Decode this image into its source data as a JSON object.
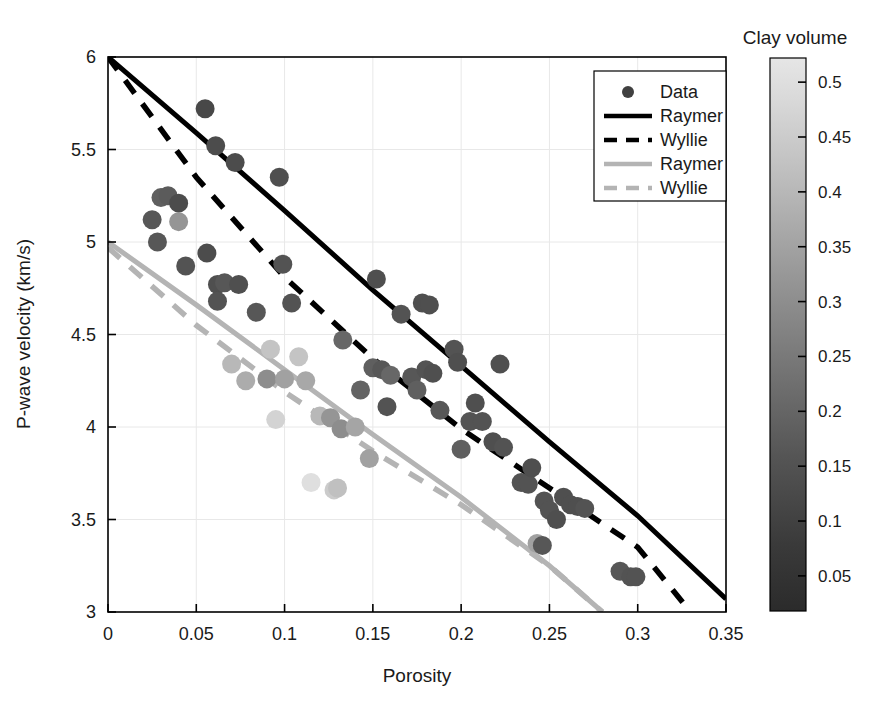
{
  "figure": {
    "background": "#ffffff",
    "width": 882,
    "height": 708
  },
  "axes": {
    "x_label": "Porosity",
    "y_label": "P-wave velocity (km/s)",
    "x_ticks": [
      "0",
      "0.05",
      "0.1",
      "0.15",
      "0.2",
      "0.25",
      "0.3",
      "0.35"
    ],
    "y_ticks": [
      "3",
      "3.5",
      "4",
      "4.5",
      "5",
      "5.5",
      "6"
    ],
    "box_color": "#000000",
    "grid": "on"
  },
  "legend": {
    "border_color": "#000000",
    "background": "#ffffff",
    "items": [
      {
        "label": "Data",
        "marker": "circle",
        "color": "#404040"
      },
      {
        "label": "Raymer",
        "marker": "solid-line",
        "color": "#000000"
      },
      {
        "label": "Wyllie",
        "marker": "dashed-line",
        "color": "#000000"
      },
      {
        "label": "Raymer",
        "marker": "solid-line",
        "color": "#b4b4b4"
      },
      {
        "label": "Wyllie",
        "marker": "dashed-line",
        "color": "#b4b4b4"
      }
    ]
  },
  "colorbar": {
    "title": "Clay volume",
    "ticks": [
      "0.05",
      "0.1",
      "0.15",
      "0.2",
      "0.25",
      "0.3",
      "0.35",
      "0.4",
      "0.45",
      "0.5"
    ],
    "tick_values": [
      0.05,
      0.1,
      0.15,
      0.2,
      0.25,
      0.3,
      0.35,
      0.4,
      0.45,
      0.5
    ],
    "vmin": 0.018,
    "vmax": 0.522,
    "colormap": "gray",
    "low_color": "#2b2b2b",
    "high_color": "#e4e4e4",
    "border_color": "#000000"
  },
  "chart_data": {
    "type": "scatter",
    "title": "",
    "xlabel": "Porosity",
    "ylabel": "P-wave velocity (km/s)",
    "xlim": [
      0,
      0.35
    ],
    "ylim": [
      3,
      6
    ],
    "grid": true,
    "legend_position": "upper-right",
    "colorbar_label": "Clay volume",
    "colorbar_range": [
      0.018,
      0.522
    ],
    "series": [
      {
        "name": "Data",
        "type": "scatter",
        "color_by": "Clay volume",
        "points": [
          {
            "x": 0.025,
            "y": 5.12,
            "c": 0.14
          },
          {
            "x": 0.03,
            "y": 5.24,
            "c": 0.16
          },
          {
            "x": 0.034,
            "y": 5.25,
            "c": 0.15
          },
          {
            "x": 0.028,
            "y": 5.0,
            "c": 0.14
          },
          {
            "x": 0.04,
            "y": 5.21,
            "c": 0.11
          },
          {
            "x": 0.04,
            "y": 5.11,
            "c": 0.3
          },
          {
            "x": 0.044,
            "y": 4.87,
            "c": 0.13
          },
          {
            "x": 0.055,
            "y": 5.72,
            "c": 0.1
          },
          {
            "x": 0.056,
            "y": 4.94,
            "c": 0.11
          },
          {
            "x": 0.061,
            "y": 5.52,
            "c": 0.11
          },
          {
            "x": 0.062,
            "y": 4.77,
            "c": 0.12
          },
          {
            "x": 0.062,
            "y": 4.68,
            "c": 0.13
          },
          {
            "x": 0.066,
            "y": 4.78,
            "c": 0.14
          },
          {
            "x": 0.072,
            "y": 5.43,
            "c": 0.11
          },
          {
            "x": 0.074,
            "y": 4.77,
            "c": 0.12
          },
          {
            "x": 0.07,
            "y": 4.34,
            "c": 0.39
          },
          {
            "x": 0.078,
            "y": 4.25,
            "c": 0.36
          },
          {
            "x": 0.084,
            "y": 4.62,
            "c": 0.14
          },
          {
            "x": 0.09,
            "y": 4.26,
            "c": 0.28
          },
          {
            "x": 0.092,
            "y": 4.42,
            "c": 0.42
          },
          {
            "x": 0.095,
            "y": 4.04,
            "c": 0.46
          },
          {
            "x": 0.097,
            "y": 5.35,
            "c": 0.12
          },
          {
            "x": 0.099,
            "y": 4.88,
            "c": 0.13
          },
          {
            "x": 0.1,
            "y": 4.26,
            "c": 0.33
          },
          {
            "x": 0.104,
            "y": 4.67,
            "c": 0.13
          },
          {
            "x": 0.108,
            "y": 4.38,
            "c": 0.42
          },
          {
            "x": 0.112,
            "y": 4.25,
            "c": 0.35
          },
          {
            "x": 0.115,
            "y": 3.7,
            "c": 0.49
          },
          {
            "x": 0.12,
            "y": 4.06,
            "c": 0.39
          },
          {
            "x": 0.126,
            "y": 4.05,
            "c": 0.3
          },
          {
            "x": 0.128,
            "y": 3.66,
            "c": 0.44
          },
          {
            "x": 0.13,
            "y": 3.67,
            "c": 0.41
          },
          {
            "x": 0.132,
            "y": 3.99,
            "c": 0.28
          },
          {
            "x": 0.133,
            "y": 4.47,
            "c": 0.18
          },
          {
            "x": 0.14,
            "y": 4.0,
            "c": 0.34
          },
          {
            "x": 0.143,
            "y": 4.2,
            "c": 0.17
          },
          {
            "x": 0.148,
            "y": 3.83,
            "c": 0.33
          },
          {
            "x": 0.15,
            "y": 4.32,
            "c": 0.16
          },
          {
            "x": 0.152,
            "y": 4.8,
            "c": 0.12
          },
          {
            "x": 0.155,
            "y": 4.31,
            "c": 0.14
          },
          {
            "x": 0.158,
            "y": 4.11,
            "c": 0.13
          },
          {
            "x": 0.16,
            "y": 4.28,
            "c": 0.18
          },
          {
            "x": 0.166,
            "y": 4.61,
            "c": 0.13
          },
          {
            "x": 0.172,
            "y": 4.27,
            "c": 0.14
          },
          {
            "x": 0.175,
            "y": 4.2,
            "c": 0.16
          },
          {
            "x": 0.178,
            "y": 4.67,
            "c": 0.12
          },
          {
            "x": 0.18,
            "y": 4.31,
            "c": 0.13
          },
          {
            "x": 0.182,
            "y": 4.66,
            "c": 0.12
          },
          {
            "x": 0.184,
            "y": 4.29,
            "c": 0.12
          },
          {
            "x": 0.188,
            "y": 4.09,
            "c": 0.14
          },
          {
            "x": 0.196,
            "y": 4.42,
            "c": 0.13
          },
          {
            "x": 0.198,
            "y": 4.35,
            "c": 0.12
          },
          {
            "x": 0.2,
            "y": 3.88,
            "c": 0.16
          },
          {
            "x": 0.205,
            "y": 4.03,
            "c": 0.13
          },
          {
            "x": 0.208,
            "y": 4.13,
            "c": 0.12
          },
          {
            "x": 0.212,
            "y": 4.03,
            "c": 0.13
          },
          {
            "x": 0.218,
            "y": 3.92,
            "c": 0.12
          },
          {
            "x": 0.222,
            "y": 4.34,
            "c": 0.12
          },
          {
            "x": 0.224,
            "y": 3.89,
            "c": 0.13
          },
          {
            "x": 0.234,
            "y": 3.7,
            "c": 0.13
          },
          {
            "x": 0.238,
            "y": 3.69,
            "c": 0.13
          },
          {
            "x": 0.24,
            "y": 3.78,
            "c": 0.12
          },
          {
            "x": 0.243,
            "y": 3.37,
            "c": 0.33
          },
          {
            "x": 0.247,
            "y": 3.6,
            "c": 0.13
          },
          {
            "x": 0.25,
            "y": 3.55,
            "c": 0.13
          },
          {
            "x": 0.254,
            "y": 3.5,
            "c": 0.12
          },
          {
            "x": 0.258,
            "y": 3.62,
            "c": 0.12
          },
          {
            "x": 0.262,
            "y": 3.58,
            "c": 0.12
          },
          {
            "x": 0.266,
            "y": 3.57,
            "c": 0.12
          },
          {
            "x": 0.27,
            "y": 3.56,
            "c": 0.13
          },
          {
            "x": 0.246,
            "y": 3.36,
            "c": 0.14
          },
          {
            "x": 0.29,
            "y": 3.22,
            "c": 0.14
          },
          {
            "x": 0.296,
            "y": 3.19,
            "c": 0.13
          },
          {
            "x": 0.299,
            "y": 3.19,
            "c": 0.13
          }
        ]
      },
      {
        "name": "Raymer (black)",
        "type": "line",
        "style": "solid",
        "color": "#000000",
        "x": [
          0,
          0.05,
          0.1,
          0.15,
          0.2,
          0.25,
          0.3,
          0.35
        ],
        "y": [
          6.0,
          5.59,
          5.17,
          4.74,
          4.33,
          3.92,
          3.52,
          3.07
        ]
      },
      {
        "name": "Wyllie (black)",
        "type": "line",
        "style": "dashed",
        "color": "#000000",
        "x": [
          0,
          0.05,
          0.1,
          0.15,
          0.2,
          0.25,
          0.3,
          0.33
        ],
        "y": [
          6.0,
          5.35,
          4.81,
          4.37,
          3.99,
          3.67,
          3.35,
          3.0
        ]
      },
      {
        "name": "Raymer (gray)",
        "type": "line",
        "style": "solid",
        "color": "#b4b4b4",
        "x": [
          0,
          0.05,
          0.1,
          0.15,
          0.2,
          0.25,
          0.28
        ],
        "y": [
          5.0,
          4.66,
          4.31,
          3.96,
          3.62,
          3.25,
          3.0
        ]
      },
      {
        "name": "Wyllie (gray)",
        "type": "line",
        "style": "dashed",
        "color": "#b4b4b4",
        "x": [
          0,
          0.05,
          0.1,
          0.15,
          0.2,
          0.25,
          0.28
        ],
        "y": [
          4.97,
          4.55,
          4.19,
          3.87,
          3.58,
          3.25,
          3.0
        ]
      }
    ]
  }
}
